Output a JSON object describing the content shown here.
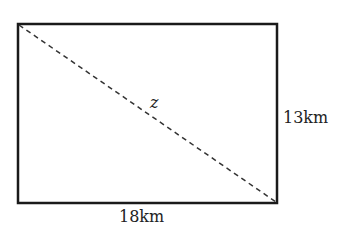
{
  "diagram": {
    "shape": "rectangle",
    "diagonal_label": "z",
    "width_label": "18km",
    "height_label": "13km",
    "colors": {
      "stroke": "#1a1a1a",
      "dashed": "#333333",
      "text": "#222222"
    }
  }
}
